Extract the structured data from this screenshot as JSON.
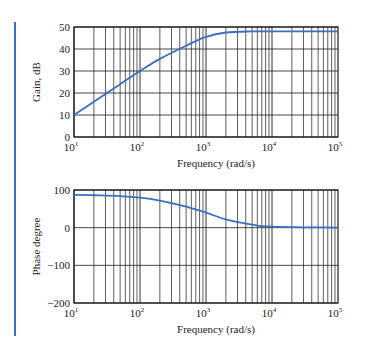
{
  "figure": {
    "accent_color": "#3a6fbf",
    "curve_color": "#3a6fbf",
    "grid_color": "#1a1a1a"
  },
  "chart_data": [
    {
      "type": "line",
      "title": "",
      "xlabel": "Frequency (rad/s)",
      "ylabel": "Gain, dB",
      "xscale": "log",
      "xlim": [
        10,
        100000
      ],
      "ylim": [
        0,
        50
      ],
      "xticks": [
        "10^1",
        "10^2",
        "10^3",
        "10^4",
        "10^5"
      ],
      "yticks": [
        0,
        10,
        20,
        30,
        40,
        50
      ],
      "grid": true,
      "series": [
        {
          "name": "Gain",
          "x": [
            10,
            20,
            50,
            100,
            200,
            500,
            1000,
            2000,
            5000,
            10000,
            100000
          ],
          "values": [
            10,
            16,
            24,
            30,
            35.5,
            41.5,
            45.5,
            47.5,
            48,
            48,
            48
          ]
        }
      ]
    },
    {
      "type": "line",
      "title": "",
      "xlabel": "Frequency (rad/s)",
      "ylabel": "Phase degree",
      "xscale": "log",
      "xlim": [
        10,
        100000
      ],
      "ylim": [
        -200,
        100
      ],
      "xticks": [
        "10^1",
        "10^2",
        "10^3",
        "10^4",
        "10^5"
      ],
      "yticks": [
        -200,
        -100,
        0,
        100
      ],
      "grid": true,
      "series": [
        {
          "name": "Phase",
          "x": [
            10,
            20,
            50,
            100,
            200,
            500,
            1000,
            2000,
            5000,
            10000,
            100000
          ],
          "values": [
            87,
            86,
            84,
            80,
            72,
            56,
            40,
            22,
            8,
            3,
            0
          ]
        }
      ]
    }
  ],
  "labels": {
    "gain_ylabel": "Gain, dB",
    "phase_ylabel": "Phase degree",
    "xlabel": "Frequency (rad/s)"
  }
}
